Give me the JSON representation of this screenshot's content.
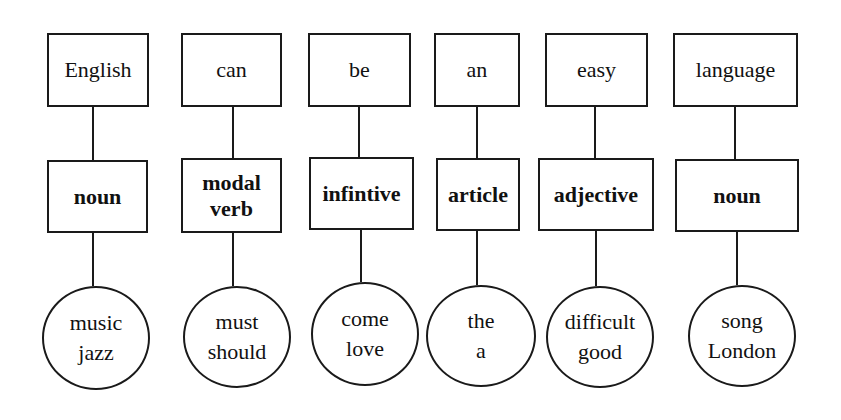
{
  "diagram": {
    "columns": [
      {
        "word": "English",
        "part_of_speech": "noun",
        "examples": [
          "music",
          "jazz"
        ],
        "geom": {
          "top": [
            47,
            33,
            102,
            74
          ],
          "mid": [
            47,
            160,
            101,
            73
          ],
          "circle": [
            42,
            286,
            108,
            104
          ],
          "lx": 93
        }
      },
      {
        "word": "can",
        "part_of_speech": "modal verb",
        "pos_lines": [
          "modal",
          "verb"
        ],
        "examples": [
          "must",
          "should"
        ],
        "geom": {
          "top": [
            181,
            33,
            101,
            74
          ],
          "mid": [
            181,
            158,
            101,
            75
          ],
          "circle": [
            183,
            286,
            108,
            102
          ],
          "lx": 233
        }
      },
      {
        "word": "be",
        "part_of_speech": "infintive",
        "examples": [
          "come",
          "love"
        ],
        "geom": {
          "top": [
            308,
            33,
            103,
            74
          ],
          "mid": [
            309,
            157,
            105,
            73
          ],
          "circle": [
            311,
            282,
            108,
            104
          ],
          "lx": 359
        }
      },
      {
        "word": "an",
        "part_of_speech": "article",
        "examples": [
          "the",
          "a"
        ],
        "geom": {
          "top": [
            434,
            33,
            86,
            74
          ],
          "mid": [
            436,
            158,
            84,
            73
          ],
          "circle": [
            426,
            285,
            110,
            102
          ],
          "lx": 477
        }
      },
      {
        "word": "easy",
        "part_of_speech": "adjective",
        "examples": [
          "difficult",
          "good"
        ],
        "geom": {
          "top": [
            545,
            33,
            103,
            74
          ],
          "mid": [
            538,
            158,
            116,
            73
          ],
          "circle": [
            546,
            286,
            108,
            102
          ],
          "lx": 595
        }
      },
      {
        "word": "language",
        "part_of_speech": "noun",
        "examples": [
          "song",
          "London"
        ],
        "geom": {
          "top": [
            673,
            33,
            125,
            74
          ],
          "mid": [
            675,
            159,
            124,
            73
          ],
          "circle": [
            688,
            285,
            108,
            102
          ],
          "lx": 735
        }
      }
    ]
  }
}
